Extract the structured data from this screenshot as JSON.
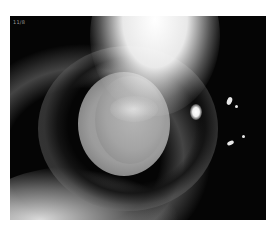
{
  "image": {
    "subject": "slit-lamp photograph of an eye with lens opacity",
    "corner_label": "11/8",
    "colors": {
      "background": "#ffffff",
      "photo_background": "#050505",
      "highlight": "#ffffff",
      "iris_gray": "#9c9c9c"
    }
  }
}
